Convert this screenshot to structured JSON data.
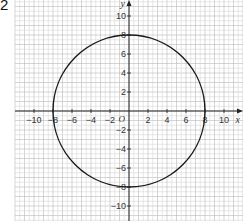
{
  "question_number": "2",
  "chart_data": {
    "type": "line",
    "title": "",
    "xlabel": "x",
    "ylabel": "y",
    "origin_label": "O",
    "xlim": [
      -11.5,
      12
    ],
    "ylim": [
      -11.5,
      11.7
    ],
    "grid": true,
    "x_ticks": [
      -10,
      -8,
      -6,
      -4,
      -2,
      2,
      4,
      6,
      8,
      10
    ],
    "y_ticks": [
      -10,
      -8,
      -6,
      -4,
      -2,
      2,
      4,
      6,
      8,
      10
    ],
    "x_tick_labels": [
      "−10",
      "−8",
      "−6",
      "−4",
      "−2",
      "2",
      "4",
      "6",
      "8",
      "10"
    ],
    "y_tick_labels": [
      "−10",
      "−8",
      "−6",
      "−4",
      "−2",
      "2",
      "4",
      "6",
      "8",
      "10"
    ],
    "series": [
      {
        "name": "circle",
        "shape": "circle",
        "center": [
          0,
          0
        ],
        "radius": 8,
        "color": "#1a1a1a"
      }
    ]
  },
  "colors": {
    "axis": "#222222",
    "grid_minor": "#d6d6d6",
    "grid_major": "#b9b9b9",
    "curve": "#1a1a1a",
    "text": "#333333"
  }
}
